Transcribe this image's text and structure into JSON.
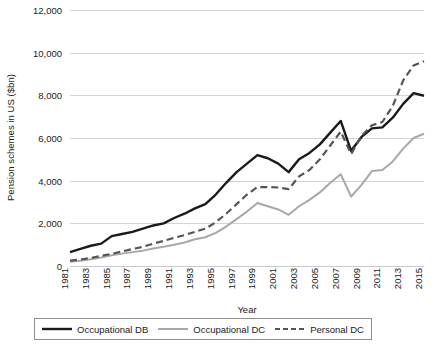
{
  "chart_data": {
    "type": "line",
    "title": "",
    "xlabel": "Year",
    "ylabel": "Pension schemes in US ($bn)",
    "xlim": [
      1981,
      2015
    ],
    "ylim": [
      0,
      12000
    ],
    "grid": true,
    "legend_position": "bottom",
    "y_ticks": [
      0,
      2000,
      4000,
      6000,
      8000,
      10000,
      12000
    ],
    "y_tick_labels": [
      "0",
      "2,000",
      "4,000",
      "6,000",
      "8,000",
      "10,000",
      "12,000"
    ],
    "x_tick_labels": [
      "1981",
      "1983",
      "1985",
      "1987",
      "1989",
      "1991",
      "1993",
      "1995",
      "1997",
      "1999",
      "2001",
      "2003",
      "2005",
      "2007",
      "2009",
      "2011",
      "2013",
      "2015"
    ],
    "x": [
      1981,
      1982,
      1983,
      1984,
      1985,
      1986,
      1987,
      1988,
      1989,
      1990,
      1991,
      1992,
      1993,
      1994,
      1995,
      1996,
      1997,
      1998,
      1999,
      2000,
      2001,
      2002,
      2003,
      2004,
      2005,
      2006,
      2007,
      2008,
      2009,
      2010,
      2011,
      2012,
      2013,
      2014,
      2015
    ],
    "series": [
      {
        "name": "Occupational DB",
        "color": "#1a1a1a",
        "style": "solid",
        "width": 2.4,
        "values": [
          650,
          800,
          950,
          1050,
          1400,
          1500,
          1600,
          1750,
          1900,
          2000,
          2250,
          2450,
          2700,
          2900,
          3350,
          3900,
          4400,
          4800,
          5200,
          5050,
          4800,
          4400,
          5000,
          5300,
          5700,
          6250,
          6800,
          5400,
          6050,
          6450,
          6500,
          6950,
          7600,
          8100,
          7980
        ]
      },
      {
        "name": "Occupational DC",
        "color": "#a8a8a8",
        "style": "solid",
        "width": 2.0,
        "values": [
          200,
          250,
          320,
          400,
          500,
          580,
          650,
          720,
          820,
          900,
          1000,
          1100,
          1250,
          1350,
          1550,
          1850,
          2200,
          2550,
          2950,
          2800,
          2650,
          2400,
          2800,
          3100,
          3450,
          3900,
          4300,
          3250,
          3800,
          4450,
          4500,
          4900,
          5500,
          6000,
          6200
        ]
      },
      {
        "name": "Personal DC",
        "color": "#555555",
        "style": "dashed",
        "width": 2.2,
        "values": [
          250,
          300,
          380,
          470,
          570,
          680,
          800,
          900,
          1050,
          1180,
          1320,
          1450,
          1600,
          1750,
          2050,
          2450,
          2900,
          3350,
          3700,
          3700,
          3680,
          3600,
          4200,
          4500,
          5000,
          5650,
          6300,
          5250,
          6100,
          6600,
          6750,
          7500,
          8700,
          9400,
          9600
        ]
      }
    ]
  },
  "legend": {
    "items": [
      {
        "label": "Occupational DB"
      },
      {
        "label": "Occupational DC"
      },
      {
        "label": "Personal DC"
      }
    ]
  }
}
